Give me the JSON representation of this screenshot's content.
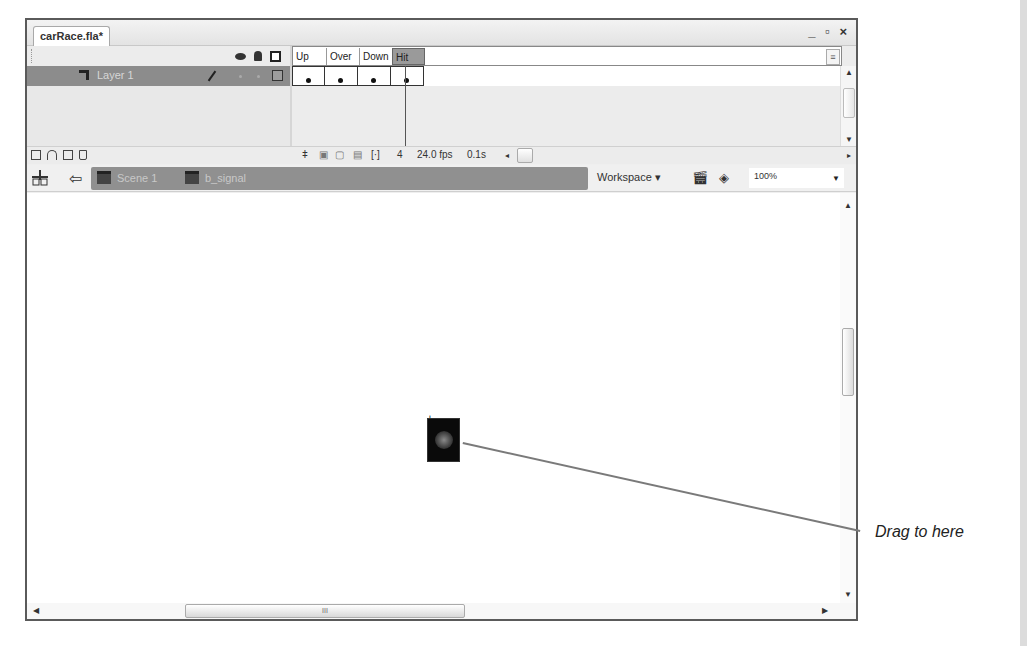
{
  "document": {
    "tab_title": "carRace.fla*",
    "window_controls": "_ ▫ ×"
  },
  "timeline": {
    "header_icons": [
      "eye-icon",
      "lock-icon",
      "outline-icon"
    ],
    "frame_labels": [
      "Up",
      "Over",
      "Down",
      "Hit"
    ],
    "selected_frame": "Hit",
    "layers": [
      {
        "name": "Layer 1",
        "keyframes": 4
      }
    ],
    "footer": {
      "current_frame": "4",
      "frame_rate": "24.0 fps",
      "elapsed_time": "0.1s"
    }
  },
  "edit_bar": {
    "breadcrumbs": [
      {
        "label": "Scene 1",
        "icon": "scene-icon"
      },
      {
        "label": "b_signal",
        "icon": "button-symbol-icon"
      }
    ],
    "workspace_label": "Workspace ▾",
    "zoom_value": "100%"
  },
  "stage": {
    "symbol": "b_signal",
    "scrollbar_grip": "III"
  },
  "annotation": {
    "callout_text": "Drag to here"
  }
}
